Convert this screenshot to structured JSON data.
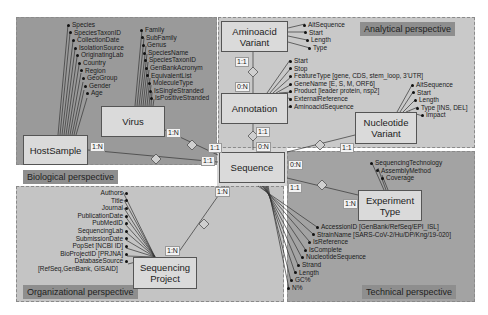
{
  "perspectives": {
    "biological": "Biological perspective",
    "analytical": "Analytical perspective",
    "organizational": "Organizational perspective",
    "technical": "Technical perspective"
  },
  "entities": {
    "host_sample": "HostSample",
    "virus": "Virus",
    "aminoacid_variant": "Aminoacid Variant",
    "annotation": "Annotation",
    "nucleotide_variant": "Nucleotide Variant",
    "sequence": "Sequence",
    "experiment_type": "Experiment Type",
    "sequencing_project": "Sequencing Project"
  },
  "attributes": {
    "host_sample": [
      "Species",
      "SpeciesTaxonID",
      "CollectionDate",
      "IsolationSource",
      "OriginatingLab",
      "Country",
      "Region",
      "GeoGroup",
      "Gender",
      "Age"
    ],
    "virus": [
      "Family",
      "SubFamily",
      "Genus",
      "SpeciesName",
      "SpeciesTaxonID",
      "GenBankAcronym",
      "EquivalentList",
      "MoleculeType",
      "IsSingleStranded",
      "IsPositiveStranded"
    ],
    "aminoacid_variant": [
      "AltSequence",
      "Start",
      "Length",
      "Type"
    ],
    "annotation": [
      "Start",
      "Stop",
      "FeatureType [gene, CDS, stem_loop, 3'UTR]",
      "GeneName [E, S, M, ORF6]",
      "Product [leader protein, nsp2]",
      "ExternalReference",
      "AminoacidSequence"
    ],
    "nucleotide_variant": [
      "AltSequence",
      "Start",
      "Length",
      "Type [INS, DEL]",
      "Impact"
    ],
    "experiment_type": [
      "SequencingTechnology",
      "AssemblyMethod",
      "Coverage"
    ],
    "sequence": [
      "AccessionID [GenBank/RefSeq/EPI_ISL]",
      "StrainName [SARS-CoV-2/Hu/DP/Kng/19-020]",
      "IsReference",
      "IsComplete",
      "NucleotideSequence",
      "Strand",
      "Length",
      "GC%",
      "N%"
    ],
    "sequencing_project": [
      "Authors",
      "Title",
      "Journal",
      "PublicationDate",
      "PubMedID",
      "SequencingLab",
      "SubmissionDate",
      "PopSet [NCBI ID]",
      "BioProjectID [PRJNA]",
      "DatabaseSource",
      "[RefSeq,GenBank, GISAID]"
    ]
  },
  "cardinalities": {
    "virus_side": "1:N",
    "virus_seq": "1:1",
    "host_side": "1:N",
    "host_seq": "1:1",
    "aa_side": "1:1",
    "aa_ann": "0:N",
    "ann_side": "1:1",
    "ann_seq": "0:N",
    "nv_side": "1:1",
    "nv_seq": "0:N",
    "exp_seq": "1:1",
    "exp_side": "1:N",
    "proj_seq": "1:N",
    "proj_side": "1:N"
  }
}
